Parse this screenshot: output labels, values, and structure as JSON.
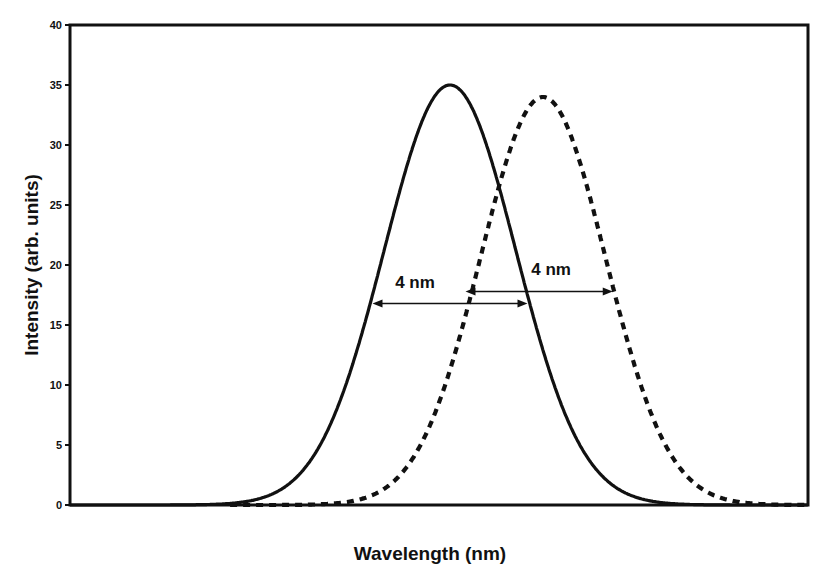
{
  "chart_data": {
    "type": "line",
    "title": "",
    "xlabel": "Wavelength (nm)",
    "ylabel": "Intensity (arb. units)",
    "ylim": [
      0,
      40
    ],
    "yticks": [
      0,
      5,
      10,
      15,
      20,
      25,
      30,
      35,
      40
    ],
    "xticks": [],
    "grid": false,
    "legend": null,
    "series": [
      {
        "name": "solid",
        "style": "solid",
        "shape": "gaussian",
        "center_nm": 0.0,
        "fwhm_nm": 4.0,
        "peak": 35,
        "x_nm": [
          -10,
          -8,
          -6,
          -5,
          -4,
          -3,
          -2,
          -1,
          0,
          1,
          2,
          3,
          4,
          5,
          6,
          8,
          10
        ],
        "values": [
          0.0,
          0.0,
          0.1,
          0.7,
          2.2,
          7.5,
          17.5,
          29.5,
          35.0,
          29.5,
          17.5,
          7.5,
          2.2,
          0.7,
          0.1,
          0.0,
          0.0
        ]
      },
      {
        "name": "dashed",
        "style": "dashed",
        "shape": "gaussian",
        "center_nm": 2.4,
        "fwhm_nm": 3.8,
        "peak": 34,
        "x_nm": [
          -6,
          -4,
          -3,
          -2,
          -1,
          0,
          1,
          2.4,
          4,
          5,
          6,
          7,
          8,
          10,
          12
        ],
        "values": [
          0.0,
          0.1,
          0.4,
          1.4,
          5.0,
          10.5,
          21.0,
          34.0,
          22.5,
          12.5,
          4.7,
          1.4,
          0.3,
          0.0,
          0.0
        ]
      }
    ],
    "annotations": [
      {
        "text": "4 nm",
        "type": "double-arrow",
        "series": "solid",
        "y": 16.8,
        "x_from_nm": -2.0,
        "x_to_nm": 2.0
      },
      {
        "text": "4 nm",
        "type": "double-arrow",
        "series": "dashed",
        "y": 17.8,
        "x_from_nm": 0.4,
        "x_to_nm": 4.2
      }
    ]
  },
  "view": {
    "plot": {
      "left": 70,
      "top": 25,
      "right": 808,
      "bottom": 505
    },
    "x_origin_px": 450,
    "px_per_nm": 38.75
  }
}
